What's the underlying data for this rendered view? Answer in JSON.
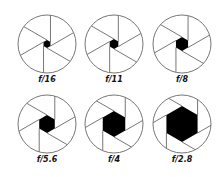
{
  "colors": {
    "outline": "#777777",
    "opening": "#000000",
    "label": "#111111",
    "background": "#ffffff"
  },
  "apertures": [
    {
      "label": "f/16",
      "cx": 47,
      "cy": 44,
      "r": 29,
      "opening": 4,
      "rotation": 0
    },
    {
      "label": "f/11",
      "cx": 114,
      "cy": 44,
      "r": 29,
      "opening": 5,
      "rotation": 0
    },
    {
      "label": "f/8",
      "cx": 182,
      "cy": 44,
      "r": 29,
      "opening": 7,
      "rotation": 0
    },
    {
      "label": "f/5.6",
      "cx": 47,
      "cy": 124,
      "r": 29,
      "opening": 9,
      "rotation": 0
    },
    {
      "label": "f/4",
      "cx": 114,
      "cy": 124,
      "r": 29,
      "opening": 13,
      "rotation": 0
    },
    {
      "label": "f/2.8",
      "cx": 182,
      "cy": 124,
      "r": 29,
      "opening": 18,
      "rotation": 0
    }
  ]
}
